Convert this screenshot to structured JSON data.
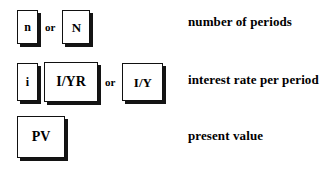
{
  "diagram": {
    "rows": [
      {
        "id": "number-of-periods",
        "keys": [
          "n",
          "N"
        ],
        "conjunction": "or",
        "description": "number of periods"
      },
      {
        "id": "interest-rate",
        "keys": [
          "i",
          "I/YR",
          "I/Y"
        ],
        "conjunction": "or",
        "description": "interest rate per period"
      },
      {
        "id": "present-value",
        "keys": [
          "PV"
        ],
        "conjunction": "",
        "description": "present value"
      }
    ]
  },
  "colors": {
    "background": "#ffffff",
    "text": "#000000",
    "key_border": "#111111",
    "key_shadow": "#141414",
    "key_fill": "#ffffff"
  }
}
